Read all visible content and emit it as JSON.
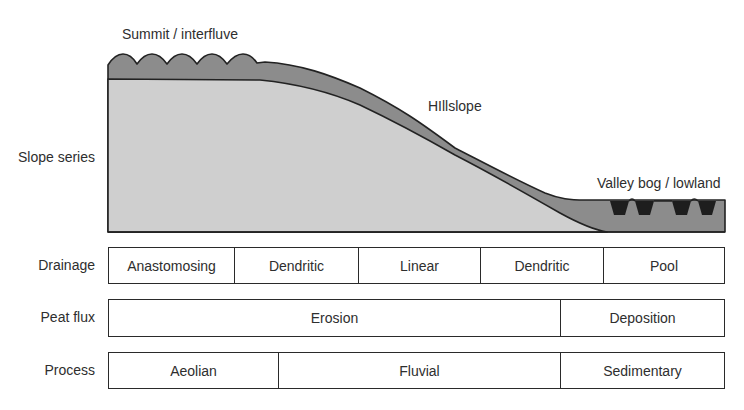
{
  "diagram": {
    "slope_labels": {
      "summit": "Summit / interfluve",
      "hillslope": "HIllslope",
      "valley": "Valley bog / lowland"
    },
    "colors": {
      "peat_layer": "#8c8c8c",
      "substrate": "#cfcfcf",
      "pools": "#1e1e1e",
      "outline": "#222222"
    },
    "rows": {
      "slope_series": {
        "label": "Slope series"
      },
      "drainage": {
        "label": "Drainage",
        "cells": [
          "Anastomosing",
          "Dendritic",
          "Linear",
          "Dendritic",
          "Pool"
        ]
      },
      "peat_flux": {
        "label": "Peat flux",
        "cells": [
          "Erosion",
          "Deposition"
        ]
      },
      "process": {
        "label": "Process",
        "cells": [
          "Aeolian",
          "Fluvial",
          "Sedimentary"
        ]
      }
    }
  }
}
